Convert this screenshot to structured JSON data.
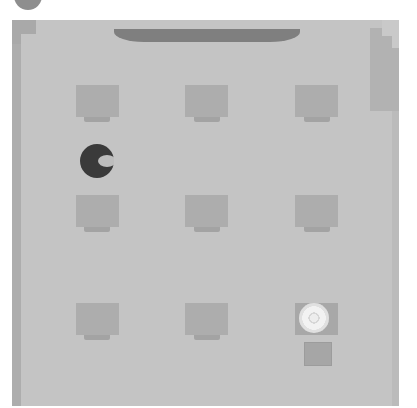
{
  "game": {
    "type": "grid-board",
    "board": {
      "background": "#c4c4c4",
      "wall_color": "#adadad",
      "top_bar_color": "#7f7f7f"
    },
    "player": {
      "kind": "pac-man-like",
      "color": "#3a3a3a",
      "mouth_color": "#bdbdbd",
      "facing": "right",
      "grid_pos": [
        0,
        0.5
      ]
    },
    "cells": [
      {
        "row": 0,
        "col": 0,
        "state": "empty"
      },
      {
        "row": 0,
        "col": 1,
        "state": "empty"
      },
      {
        "row": 0,
        "col": 2,
        "state": "empty"
      },
      {
        "row": 1,
        "col": 0,
        "state": "empty"
      },
      {
        "row": 1,
        "col": 1,
        "state": "empty"
      },
      {
        "row": 1,
        "col": 2,
        "state": "empty"
      },
      {
        "row": 2,
        "col": 0,
        "state": "empty"
      },
      {
        "row": 2,
        "col": 1,
        "state": "empty"
      },
      {
        "row": 2,
        "col": 2,
        "state": "lit-goal"
      }
    ],
    "extra_items": [
      {
        "kind": "small-square",
        "below_cell": [
          2,
          2
        ]
      }
    ]
  }
}
